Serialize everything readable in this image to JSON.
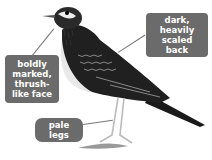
{
  "figure": {
    "annotations": [
      {
        "id": "back",
        "text": "dark, heavily scaled back"
      },
      {
        "id": "face",
        "text": "boldly marked, thrush-like face"
      },
      {
        "id": "legs",
        "text": "pale legs"
      }
    ]
  },
  "labels": {
    "back": "dark, heavily scaled back",
    "face": "boldly marked, thrush-like face",
    "legs": "pale legs"
  },
  "colors": {
    "label_bg": "#6b6b6b",
    "label_text": "#ffffff",
    "leader_line": "#777777"
  }
}
